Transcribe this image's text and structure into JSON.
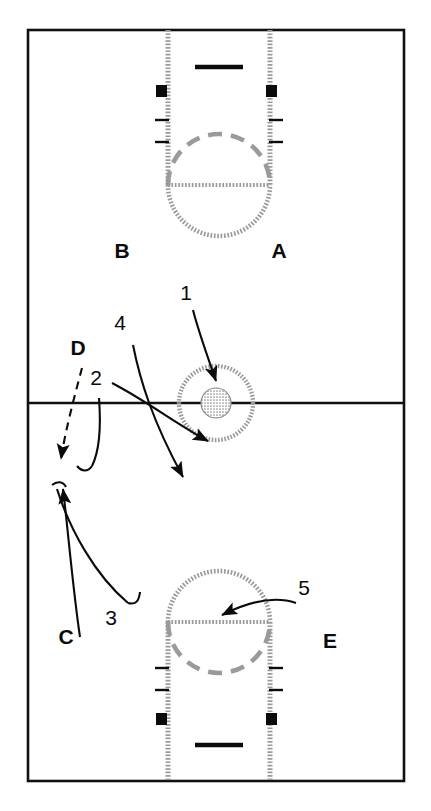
{
  "diagram": {
    "court": {
      "boundary_color": "#111111",
      "line_color": "#111111",
      "marking_color": "#9a9a9a",
      "background": "#ffffff",
      "left": 28,
      "top": 30,
      "right": 404,
      "bottom": 781,
      "halfcourt_y": 403
    },
    "position_labels": [
      {
        "id": "A",
        "text": "A",
        "x": 279,
        "y": 258
      },
      {
        "id": "B",
        "text": "B",
        "x": 122,
        "y": 258
      },
      {
        "id": "C",
        "text": "C",
        "x": 66,
        "y": 644
      },
      {
        "id": "D",
        "text": "D",
        "x": 78,
        "y": 355
      },
      {
        "id": "E",
        "text": "E",
        "x": 330,
        "y": 648
      }
    ],
    "route_labels": [
      {
        "id": "1",
        "text": "1",
        "x": 186,
        "y": 300
      },
      {
        "id": "2",
        "text": "2",
        "x": 96,
        "y": 385
      },
      {
        "id": "3",
        "text": "3",
        "x": 111,
        "y": 625
      },
      {
        "id": "4",
        "text": "4",
        "x": 120,
        "y": 330
      },
      {
        "id": "5",
        "text": "5",
        "x": 304,
        "y": 595
      }
    ],
    "top_key": {
      "name": "top-key",
      "lane_left_x": 168,
      "lane_right_x": 270,
      "baseline_y": 30,
      "freethrow_y": 185,
      "backboard_x1": 195,
      "backboard_x2": 243,
      "backboard_y": 67,
      "hoop_markers": [
        {
          "x": 161,
          "y": 90
        },
        {
          "x": 264,
          "y": 90
        }
      ],
      "hash_marks_y": [
        120,
        142
      ]
    },
    "bottom_key": {
      "name": "bottom-key",
      "lane_left_x": 168,
      "lane_right_x": 270,
      "baseline_y": 781,
      "freethrow_y": 622,
      "backboard_x1": 195,
      "backboard_x2": 243,
      "backboard_y": 745,
      "hoop_markers": [
        {
          "x": 161,
          "y": 719
        },
        {
          "x": 264,
          "y": 719
        }
      ],
      "hash_marks_y": [
        668,
        690
      ]
    },
    "center_circle": {
      "cx": 216,
      "cy": 403,
      "outer_radius": 37,
      "inner_radius": 15
    }
  }
}
